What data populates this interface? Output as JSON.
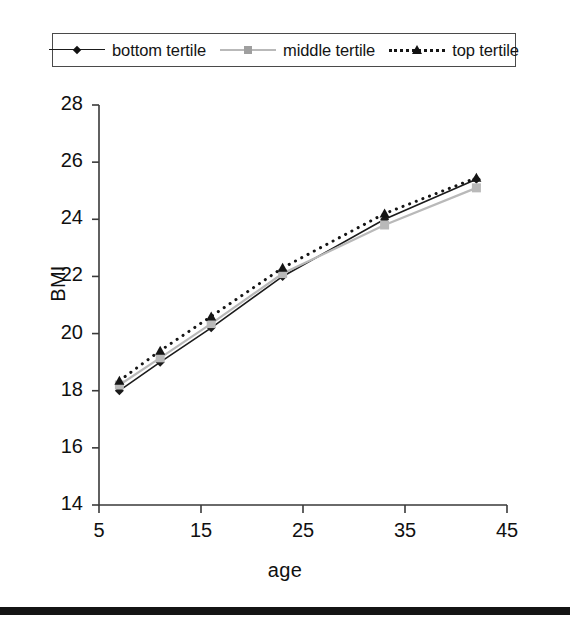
{
  "chart_data": {
    "type": "line",
    "title": "",
    "subtitle": "",
    "xlabel": "age",
    "ylabel": "BMI",
    "xlim": [
      5,
      45
    ],
    "ylim": [
      14,
      28
    ],
    "xticks": [
      5,
      15,
      25,
      35,
      45
    ],
    "yticks": [
      14,
      16,
      18,
      20,
      22,
      24,
      26,
      28
    ],
    "grid": false,
    "legend_position": "top",
    "x": [
      7,
      11,
      16,
      23,
      33,
      42
    ],
    "series": [
      {
        "name": "bottom tertile",
        "values": [
          18.0,
          19.0,
          20.2,
          22.0,
          24.0,
          25.4
        ],
        "color": "#1b1b1b",
        "line_style": "solid",
        "marker": "diamond"
      },
      {
        "name": "middle tertile",
        "values": [
          18.2,
          19.15,
          20.35,
          22.1,
          23.8,
          25.1
        ],
        "color": "#b9b9b9",
        "line_style": "solid",
        "marker": "square"
      },
      {
        "name": "top tertile",
        "values": [
          18.35,
          19.4,
          20.6,
          22.3,
          24.2,
          25.45
        ],
        "color": "#151515",
        "line_style": "dotted",
        "marker": "triangle"
      }
    ]
  },
  "legend": {
    "entries": [
      {
        "label": "bottom tertile"
      },
      {
        "label": "middle tertile"
      },
      {
        "label": "top tertile"
      }
    ]
  },
  "axes": {
    "y_title": "BMI",
    "x_title": "age",
    "y_tick_labels": [
      "28",
      "26",
      "24",
      "22",
      "20",
      "18",
      "16",
      "14"
    ],
    "x_tick_labels": [
      "5",
      "15",
      "25",
      "35",
      "45"
    ]
  }
}
